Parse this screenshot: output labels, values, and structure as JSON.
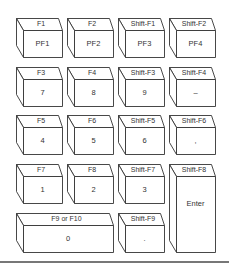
{
  "diagram": {
    "type": "keypad-mapping",
    "keys": [
      {
        "id": "pf1",
        "top": "F1",
        "front": "PF1",
        "col": 0,
        "row": 0,
        "w": 1,
        "h": 1
      },
      {
        "id": "pf2",
        "top": "F2",
        "front": "PF2",
        "col": 1,
        "row": 0,
        "w": 1,
        "h": 1
      },
      {
        "id": "pf3",
        "top": "Shift-F1",
        "front": "PF3",
        "col": 2,
        "row": 0,
        "w": 1,
        "h": 1
      },
      {
        "id": "pf4",
        "top": "Shift-F2",
        "front": "PF4",
        "col": 3,
        "row": 0,
        "w": 1,
        "h": 1
      },
      {
        "id": "k7",
        "top": "F3",
        "front": "7",
        "col": 0,
        "row": 1,
        "w": 1,
        "h": 1
      },
      {
        "id": "k8",
        "top": "F4",
        "front": "8",
        "col": 1,
        "row": 1,
        "w": 1,
        "h": 1
      },
      {
        "id": "k9",
        "top": "Shift-F3",
        "front": "9",
        "col": 2,
        "row": 1,
        "w": 1,
        "h": 1
      },
      {
        "id": "minus",
        "top": "Shift-F4",
        "front": "–",
        "col": 3,
        "row": 1,
        "w": 1,
        "h": 1
      },
      {
        "id": "k4",
        "top": "F5",
        "front": "4",
        "col": 0,
        "row": 2,
        "w": 1,
        "h": 1
      },
      {
        "id": "k5",
        "top": "F6",
        "front": "5",
        "col": 1,
        "row": 2,
        "w": 1,
        "h": 1
      },
      {
        "id": "k6",
        "top": "Shift-F5",
        "front": "6",
        "col": 2,
        "row": 2,
        "w": 1,
        "h": 1
      },
      {
        "id": "comma",
        "top": "Shift-F6",
        "front": ",",
        "col": 3,
        "row": 2,
        "w": 1,
        "h": 1
      },
      {
        "id": "k1",
        "top": "F7",
        "front": "1",
        "col": 0,
        "row": 3,
        "w": 1,
        "h": 1
      },
      {
        "id": "k2",
        "top": "F8",
        "front": "2",
        "col": 1,
        "row": 3,
        "w": 1,
        "h": 1
      },
      {
        "id": "k3",
        "top": "Shift-F7",
        "front": "3",
        "col": 2,
        "row": 3,
        "w": 1,
        "h": 1
      },
      {
        "id": "enter",
        "top": "Shift-F8",
        "front": "Enter",
        "col": 3,
        "row": 3,
        "w": 1,
        "h": 2
      },
      {
        "id": "k0",
        "top": "F9 or F10",
        "front": "0",
        "col": 0,
        "row": 4,
        "w": 2,
        "h": 1
      },
      {
        "id": "period",
        "top": "Shift-F9",
        "front": ".",
        "col": 2,
        "row": 4,
        "w": 1,
        "h": 1
      }
    ]
  },
  "colors": {
    "stroke": "#333333",
    "fill": "#ffffff",
    "text": "#333333",
    "rule": "#777777"
  }
}
